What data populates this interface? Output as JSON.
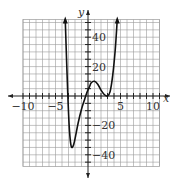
{
  "chart_data": {
    "type": "line",
    "title": "",
    "xlabel": "x",
    "ylabel": "y",
    "xlim": [
      -10,
      11
    ],
    "ylim": [
      -48,
      52
    ],
    "grid": true,
    "x_grid_step": 1,
    "y_grid_step": 5,
    "x_ticks": [
      -10,
      -5,
      5,
      10
    ],
    "y_ticks": [
      40,
      20,
      -20,
      -40
    ],
    "x_tick_labels": [
      "-10",
      "-5",
      "5",
      "10"
    ],
    "y_tick_labels": [
      "40",
      "20",
      "-20",
      "-40"
    ],
    "series": [
      {
        "name": "f(x)",
        "description": "Polynomial curve with arrows at both ends pointing up",
        "key_points": [
          {
            "x": -3.5,
            "y": 52,
            "note": "exits top (arrow)"
          },
          {
            "x": -3.1,
            "y": 0,
            "note": "x-intercept"
          },
          {
            "x": -2.5,
            "y": -35,
            "note": "local minimum"
          },
          {
            "x": -0.4,
            "y": 0,
            "note": "x-intercept"
          },
          {
            "x": 0,
            "y": -5,
            "note": "y-intercept approx"
          },
          {
            "x": 1,
            "y": 10,
            "note": "local maximum"
          },
          {
            "x": 3,
            "y": 0,
            "note": "local minimum / double root"
          },
          {
            "x": 4.5,
            "y": 52,
            "note": "exits top (arrow)"
          }
        ],
        "x": [
          -3.5,
          -3.3,
          -3.1,
          -2.9,
          -2.7,
          -2.5,
          -2.2,
          -1.9,
          -1.5,
          -1.0,
          -0.5,
          -0.2,
          0.2,
          0.5,
          1.0,
          1.5,
          2.0,
          2.5,
          3.0,
          3.4,
          3.8,
          4.2,
          4.5
        ],
        "values": [
          52,
          25,
          0,
          -20,
          -31,
          -35,
          -33,
          -27,
          -18,
          -9,
          -2,
          2,
          6,
          9,
          10,
          8,
          4,
          1,
          0,
          3,
          14,
          32,
          52
        ],
        "color": "#111111"
      }
    ]
  },
  "axes": {
    "x_label": "x",
    "y_label": "y"
  },
  "colors": {
    "grid": "#9a9a9a",
    "axis": "#222222",
    "curve": "#111111",
    "background": "#ffffff"
  }
}
